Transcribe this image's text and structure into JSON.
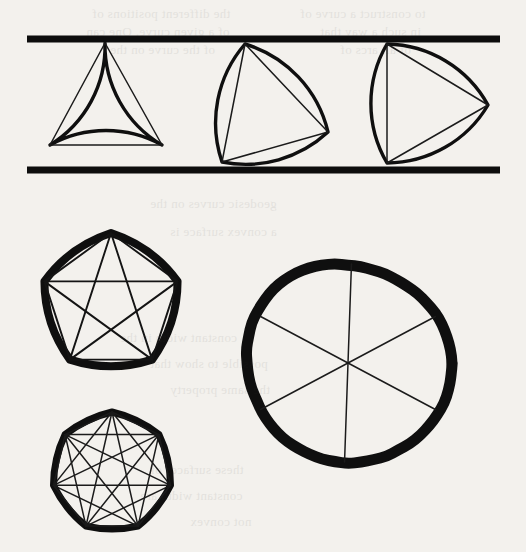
{
  "figure": {
    "background_color": "#f3f1ed",
    "ink_color": "#111111",
    "canvas": {
      "width": 526,
      "height": 552
    }
  },
  "rails": {
    "label": "parallel support lines",
    "x_start": 27,
    "x_end": 500,
    "top_y": 39,
    "bottom_y": 170,
    "separation": 131,
    "stroke_width": 7,
    "color": "#0d0d0d"
  },
  "shapes": [
    {
      "id": "reuleaux-triangle-1",
      "name": "Reuleaux triangle (0 degrees)",
      "sides": 3,
      "width": 131,
      "rotation_deg": 0,
      "vertices": [
        [
          105,
          43
        ],
        [
          50,
          145
        ],
        [
          162,
          145
        ]
      ],
      "outline_stroke": 3.4,
      "chord_stroke": 1.5
    },
    {
      "id": "reuleaux-triangle-2",
      "name": "Reuleaux triangle (rotated)",
      "sides": 3,
      "width": 131,
      "rotation_deg": 22,
      "vertices": [
        [
          245,
          44
        ],
        [
          328,
          132
        ],
        [
          222,
          162
        ]
      ],
      "outline_stroke": 3.4,
      "chord_stroke": 1.5
    },
    {
      "id": "reuleaux-triangle-3",
      "name": "Reuleaux triangle (rotated further)",
      "sides": 3,
      "width": 131,
      "rotation_deg": 40,
      "vertices": [
        [
          387,
          44
        ],
        [
          488,
          105
        ],
        [
          387,
          163
        ]
      ],
      "outline_stroke": 3.4,
      "chord_stroke": 1.5
    },
    {
      "id": "reuleaux-pentagon",
      "name": "Reuleaux pentagon with pentagram",
      "sides": 5,
      "center": [
        111,
        303
      ],
      "radius": 70,
      "rotation_deg": -90,
      "outline_stroke": 8,
      "chord_stroke": 1.6,
      "inscribed": [
        "pentagon-edges",
        "pentagram-diagonals"
      ]
    },
    {
      "id": "reuleaux-heptagon",
      "name": "Reuleaux heptagon with heptagram",
      "sides": 7,
      "center": [
        112,
        472
      ],
      "radius": 60,
      "rotation_deg": -90,
      "outline_stroke": 7,
      "chord_stroke": 1.5,
      "inscribed": [
        "heptagon-edges",
        "heptagram-diagonals"
      ]
    },
    {
      "id": "circle",
      "name": "Circle with three diameters",
      "sides": 0,
      "center": [
        348,
        363
      ],
      "radius": 101,
      "outline_stroke": 11,
      "chord_stroke": 1.7,
      "diameters_deg": [
        92,
        28,
        152
      ]
    }
  ],
  "bleed_text": {
    "note": "faint show-through text from the reverse side of the scanned page",
    "lines": [
      {
        "text": "the different positions of",
        "x": 92,
        "y": 6,
        "size": 13
      },
      {
        "text": "to construct a curve of",
        "x": 300,
        "y": 6,
        "size": 13
      },
      {
        "text": "of a given curve. One can",
        "x": 86,
        "y": 24,
        "size": 13
      },
      {
        "text": "in such a way that",
        "x": 320,
        "y": 24,
        "size": 13
      },
      {
        "text": "of the curve on the",
        "x": 110,
        "y": 42,
        "size": 13
      },
      {
        "text": "of all arcs of",
        "x": 340,
        "y": 42,
        "size": 13
      },
      {
        "text": "geodesic curves on the",
        "x": 150,
        "y": 196,
        "size": 13
      },
      {
        "text": "a convex surface is",
        "x": 170,
        "y": 224,
        "size": 13
      },
      {
        "text": "constant width in the",
        "x": 120,
        "y": 330,
        "size": 13
      },
      {
        "text": "possible to show that",
        "x": 150,
        "y": 356,
        "size": 13
      },
      {
        "text": "the same property",
        "x": 170,
        "y": 382,
        "size": 13
      },
      {
        "text": "these surfaces of",
        "x": 150,
        "y": 462,
        "size": 13
      },
      {
        "text": "constant width are",
        "x": 140,
        "y": 488,
        "size": 13
      },
      {
        "text": "not convex",
        "x": 190,
        "y": 514,
        "size": 13
      }
    ]
  }
}
